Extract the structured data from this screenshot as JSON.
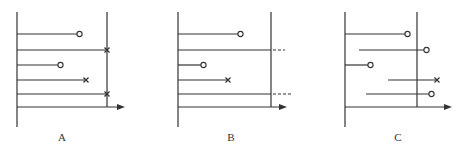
{
  "figure": {
    "stroke_color": "#333333",
    "panels": [
      {
        "label": "A",
        "left_x": 17,
        "right_x": 107,
        "top_y": 12,
        "bottom_y": 127,
        "axis_y": 107,
        "axis_end_x": 125,
        "rows": [
          {
            "y": 34,
            "x1": 17,
            "x2": 77,
            "end": "circle"
          },
          {
            "y": 50,
            "x1": 17,
            "x2": 107,
            "end": "cross"
          },
          {
            "y": 65,
            "x1": 17,
            "x2": 58,
            "end": "circle"
          },
          {
            "y": 80,
            "x1": 17,
            "x2": 86,
            "end": "cross"
          },
          {
            "y": 94,
            "x1": 17,
            "x2": 107,
            "end": "cross"
          }
        ]
      },
      {
        "label": "B",
        "left_x": 178,
        "right_x": 271,
        "top_y": 12,
        "bottom_y": 127,
        "axis_y": 107,
        "axis_end_x": 287,
        "rows": [
          {
            "y": 34,
            "x1": 178,
            "x2": 238,
            "end": "circle"
          },
          {
            "y": 50,
            "x1": 178,
            "x2": 271,
            "end": "dashed",
            "dash_to": 285
          },
          {
            "y": 65,
            "x1": 178,
            "x2": 201,
            "end": "circle"
          },
          {
            "y": 80,
            "x1": 178,
            "x2": 228,
            "end": "cross"
          },
          {
            "y": 94,
            "x1": 178,
            "x2": 271,
            "end": "dashed",
            "dash_to": 293
          }
        ]
      },
      {
        "label": "C",
        "left_x": 345,
        "right_x": 417,
        "top_y": 12,
        "bottom_y": 127,
        "axis_y": 107,
        "axis_end_x": 452,
        "rows": [
          {
            "y": 34,
            "x1": 345,
            "x2": 405,
            "end": "circle"
          },
          {
            "y": 50,
            "x1": 359,
            "x2": 424,
            "end": "circle"
          },
          {
            "y": 65,
            "x1": 345,
            "x2": 368,
            "end": "circle"
          },
          {
            "y": 80,
            "x1": 388,
            "x2": 437,
            "end": "cross"
          },
          {
            "y": 94,
            "x1": 366,
            "x2": 429,
            "end": "circle"
          }
        ]
      }
    ]
  }
}
